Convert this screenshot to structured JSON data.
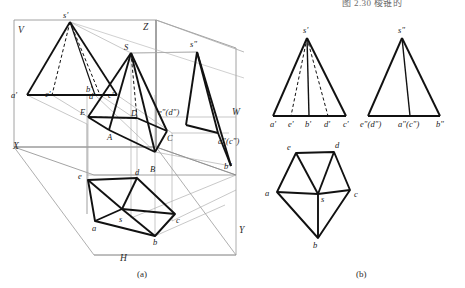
{
  "figure": {
    "caption_top": "图 2.30  棱锥的",
    "caption_a": "(a)",
    "caption_b": "(b)",
    "colors": {
      "ink": "#111111",
      "thin_line": "#8c8c8c",
      "projector": "#9a9a9a",
      "caption_grey": "#6d6d6d"
    }
  },
  "panel_a": {
    "name": "pictorial-three-plane-projection",
    "plane_labels": [
      {
        "id": "V",
        "text": "V",
        "x": 18,
        "y": 26
      },
      {
        "id": "Z",
        "text": "Z",
        "x": 143,
        "y": 23
      },
      {
        "id": "W",
        "text": "W",
        "x": 232,
        "y": 108
      },
      {
        "id": "X",
        "text": "X",
        "x": 13,
        "y": 142
      },
      {
        "id": "Y",
        "text": "Y",
        "x": 239,
        "y": 226
      },
      {
        "id": "H",
        "text": "H",
        "x": 120,
        "y": 254
      }
    ],
    "frontal_projection": {
      "apex_label": "s'",
      "base_labels": [
        "a'",
        "e'",
        "b'",
        "d'",
        "c'"
      ]
    },
    "space_object": {
      "apex_label": "S",
      "vertex_labels": [
        "A",
        "B",
        "C",
        "D",
        "E"
      ]
    },
    "profile_projection": {
      "apex_label": "s\"",
      "base_labels": [
        "e\"(d\")",
        "a\"(c\")",
        "b\""
      ]
    },
    "horizontal_projection": {
      "center_label": "s",
      "base_labels": [
        "a",
        "b",
        "c",
        "d",
        "e"
      ]
    }
  },
  "panel_b": {
    "name": "orthographic-three-views",
    "front_view": {
      "apex_label": "s'",
      "base_labels": [
        "a'",
        "e'",
        "b'",
        "d'",
        "c'"
      ]
    },
    "side_view": {
      "apex_label": "s\"",
      "base_labels": [
        "e\"(d\")",
        "a\"(c\")",
        "b\""
      ]
    },
    "top_view": {
      "center_label": "s",
      "base_labels": [
        "a",
        "b",
        "c",
        "d",
        "e"
      ]
    }
  },
  "labels_a": [
    {
      "n": "label-s-prime-a",
      "t": "s'",
      "x": 63,
      "y": 11
    },
    {
      "n": "label-a-prime-a",
      "t": "a'",
      "x": 11,
      "y": 91
    },
    {
      "n": "label-e-prime-a",
      "t": "e'",
      "x": 45,
      "y": 90
    },
    {
      "n": "label-b-prime-a",
      "t": "b'",
      "x": 86,
      "y": 87
    },
    {
      "n": "label-d-prime-a",
      "t": "d'",
      "x": 89,
      "y": 94
    },
    {
      "n": "label-c-prime-a",
      "t": "c'",
      "x": 108,
      "y": 93
    },
    {
      "n": "label-S-a",
      "t": "S",
      "x": 124,
      "y": 47
    },
    {
      "n": "label-E-a",
      "t": "E",
      "x": 82,
      "y": 111
    },
    {
      "n": "label-D-a",
      "t": "D",
      "x": 132,
      "y": 112
    },
    {
      "n": "label-A-a",
      "t": "A",
      "x": 109,
      "y": 137
    },
    {
      "n": "label-B-a",
      "t": "B",
      "x": 150,
      "y": 167
    },
    {
      "n": "label-C-a",
      "t": "C",
      "x": 168,
      "y": 138
    },
    {
      "n": "label-s-dprime-a",
      "t": "s\"",
      "x": 190,
      "y": 44
    },
    {
      "n": "label-ed-dprime-a",
      "t": "e\"(d\")",
      "x": 160,
      "y": 110
    },
    {
      "n": "label-ac-dprime-a",
      "t": "a\"(c\")",
      "x": 218,
      "y": 139
    },
    {
      "n": "label-b-dprime-a",
      "t": "b\"",
      "x": 224,
      "y": 164
    },
    {
      "n": "label-e-h-a",
      "t": "e",
      "x": 80,
      "y": 174
    },
    {
      "n": "label-d-h-a",
      "t": "d",
      "x": 136,
      "y": 171
    },
    {
      "n": "label-a-h-a",
      "t": "a",
      "x": 95,
      "y": 230
    },
    {
      "n": "label-s-h-a",
      "t": "s",
      "x": 120,
      "y": 224
    },
    {
      "n": "label-b-h-a",
      "t": "b",
      "x": 155,
      "y": 240
    },
    {
      "n": "label-c-h-a",
      "t": "c",
      "x": 174,
      "y": 224
    }
  ],
  "labels_b": [
    {
      "n": "label-s-prime-b",
      "t": "s'",
      "x": 300,
      "y": 29
    },
    {
      "n": "label-a-prime-b",
      "t": "a'",
      "x": 272,
      "y": 121
    },
    {
      "n": "label-e-prime-b",
      "t": "e'",
      "x": 290,
      "y": 121
    },
    {
      "n": "label-b-prime-b",
      "t": "b'",
      "x": 307,
      "y": 121
    },
    {
      "n": "label-d-prime-b",
      "t": "d'",
      "x": 325,
      "y": 121
    },
    {
      "n": "label-c-prime-b",
      "t": "c'",
      "x": 343,
      "y": 121
    },
    {
      "n": "label-s-dprime-b",
      "t": "s\"",
      "x": 394,
      "y": 29
    },
    {
      "n": "label-ed-dprime-b",
      "t": "e\"(d\")",
      "x": 362,
      "y": 121
    },
    {
      "n": "label-ac-dprime-b",
      "t": "a\"(c\")",
      "x": 400,
      "y": 121
    },
    {
      "n": "label-b-dprime-b",
      "t": "b\"",
      "x": 437,
      "y": 121
    },
    {
      "n": "label-e-top-b",
      "t": "e",
      "x": 288,
      "y": 147
    },
    {
      "n": "label-d-top-b",
      "t": "d",
      "x": 336,
      "y": 145
    },
    {
      "n": "label-a-top-b",
      "t": "a",
      "x": 265,
      "y": 194
    },
    {
      "n": "label-s-top-b",
      "t": "s",
      "x": 317,
      "y": 199
    },
    {
      "n": "label-c-top-b",
      "t": "c",
      "x": 354,
      "y": 196
    },
    {
      "n": "label-b-top-b",
      "t": "b",
      "x": 311,
      "y": 245
    }
  ],
  "captions": [
    {
      "n": "caption-a",
      "t": "(a)",
      "x": 137,
      "y": 272
    },
    {
      "n": "caption-b",
      "t": "(b)",
      "x": 356,
      "y": 272
    }
  ]
}
